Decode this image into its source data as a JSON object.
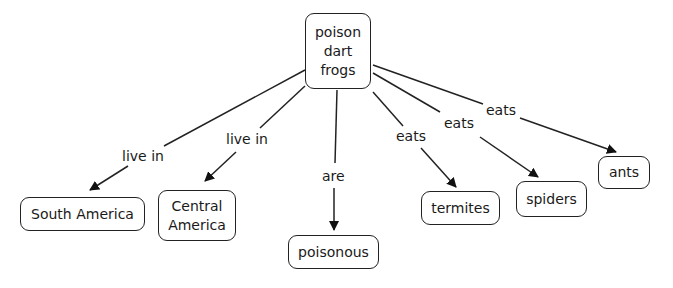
{
  "concept_map": {
    "root": {
      "label": "poison\ndart\nfrogs"
    },
    "nodes": [
      {
        "id": "south-america",
        "label": "South America"
      },
      {
        "id": "central-america",
        "label": "Central\nAmerica"
      },
      {
        "id": "poisonous",
        "label": "poisonous"
      },
      {
        "id": "termites",
        "label": "termites"
      },
      {
        "id": "spiders",
        "label": "spiders"
      },
      {
        "id": "ants",
        "label": "ants"
      }
    ],
    "links": [
      {
        "from": "poison dart frogs",
        "to": "South America",
        "label": "live in"
      },
      {
        "from": "poison dart frogs",
        "to": "Central America",
        "label": "live in"
      },
      {
        "from": "poison dart frogs",
        "to": "poisonous",
        "label": "are"
      },
      {
        "from": "poison dart frogs",
        "to": "termites",
        "label": "eats"
      },
      {
        "from": "poison dart frogs",
        "to": "spiders",
        "label": "eats"
      },
      {
        "from": "poison dart frogs",
        "to": "ants",
        "label": "eats"
      }
    ]
  }
}
